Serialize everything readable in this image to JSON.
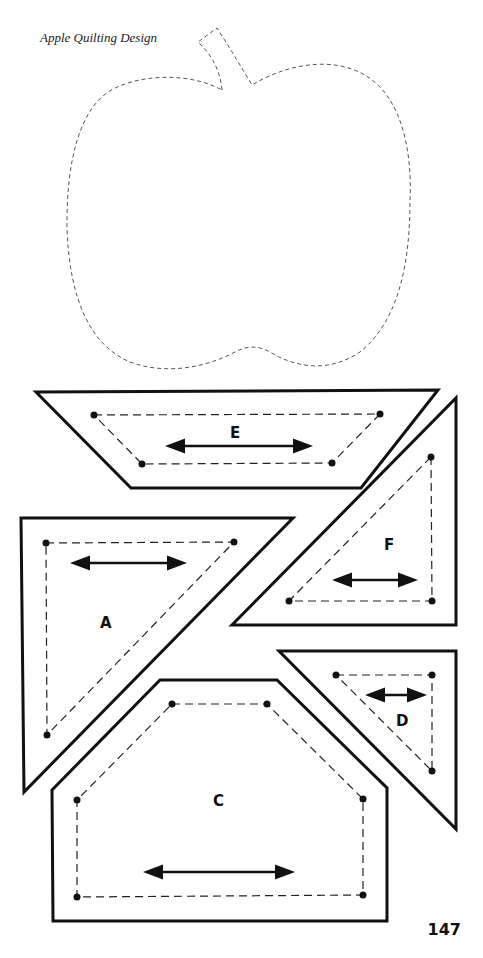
{
  "header": {
    "caption": "Apple Quilting Design"
  },
  "footer": {
    "page_number": "147"
  },
  "apple": {
    "name": "apple-outline",
    "stroke": "#555555",
    "style": "dashed"
  },
  "pieces": [
    {
      "id": "E",
      "label": "E",
      "shape": "trapezoid"
    },
    {
      "id": "F",
      "label": "F",
      "shape": "right-triangle"
    },
    {
      "id": "A",
      "label": "A",
      "shape": "right-triangle"
    },
    {
      "id": "D",
      "label": "D",
      "shape": "right-triangle"
    },
    {
      "id": "C",
      "label": "C",
      "shape": "house-pentagon"
    }
  ],
  "colors": {
    "outline": "#111111",
    "seam": "#222222",
    "background": "#ffffff"
  }
}
